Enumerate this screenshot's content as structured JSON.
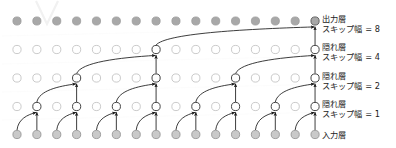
{
  "figure": {
    "title_hidden_watermark": "V",
    "background_color": "#ffffff",
    "node_fill_active": "#ffffff",
    "node_fill_inactive_top": "#a8a8a8",
    "node_fill_inactive_bottom": "#c9c9c9",
    "node_stroke": "#6f6f6f",
    "arrow_color": "#1a1a1a",
    "label_color": "#1c1c1c"
  },
  "labels": {
    "output_layer": {
      "main": "出力層",
      "sub": "スキップ幅 = 8"
    },
    "hidden_layer_4": {
      "main": "隠れ層",
      "sub": "スキップ幅 = 4"
    },
    "hidden_layer_2": {
      "main": "隠れ層",
      "sub": "スキップ幅 = 2"
    },
    "hidden_layer_1": {
      "main": "隠れ層",
      "sub": "スキップ幅 = 1"
    },
    "input_layer": {
      "main": "入力層",
      "sub": ""
    }
  },
  "chart_data": {
    "type": "diagram",
    "title": "",
    "columns": 16,
    "rows": 5,
    "geometry": {
      "x_first": 17,
      "x_step": 19.87,
      "node_radius": 4.1,
      "row_y": [
        21,
        49.5,
        78,
        106.5,
        134.5
      ]
    },
    "layers": [
      {
        "index": 0,
        "name": "output",
        "label_main": "出力層",
        "label_sub": "スキップ幅 = 8",
        "dilation": 8,
        "y": 21,
        "node_style": "filled-dark",
        "active_nodes": [
          15
        ]
      },
      {
        "index": 1,
        "name": "hidden-4",
        "label_main": "隠れ層",
        "label_sub": "スキップ幅 = 4",
        "dilation": 4,
        "y": 49.5,
        "node_style": "hollow",
        "active_nodes": [
          7,
          15
        ]
      },
      {
        "index": 2,
        "name": "hidden-2",
        "label_main": "隠れ層",
        "label_sub": "スキップ幅 = 2",
        "dilation": 2,
        "y": 78,
        "node_style": "hollow",
        "active_nodes": [
          3,
          7,
          11,
          15
        ]
      },
      {
        "index": 3,
        "name": "hidden-1",
        "label_main": "隠れ層",
        "label_sub": "スキップ幅 = 1",
        "dilation": 1,
        "y": 106.5,
        "node_style": "hollow",
        "active_nodes": [
          1,
          3,
          5,
          7,
          9,
          11,
          13,
          15
        ]
      },
      {
        "index": 4,
        "name": "input",
        "label_main": "入力層",
        "label_sub": "",
        "dilation": 0,
        "y": 134.5,
        "node_style": "filled-light",
        "active_nodes": [
          0,
          1,
          2,
          3,
          4,
          5,
          6,
          7,
          8,
          9,
          10,
          11,
          12,
          13,
          14,
          15
        ]
      }
    ],
    "edges": [
      {
        "from_layer": 4,
        "from_col": 1,
        "to_layer": 3,
        "to_col": 1,
        "kind": "vertical"
      },
      {
        "from_layer": 4,
        "from_col": 0,
        "to_layer": 3,
        "to_col": 1,
        "kind": "curve"
      },
      {
        "from_layer": 4,
        "from_col": 3,
        "to_layer": 3,
        "to_col": 3,
        "kind": "vertical"
      },
      {
        "from_layer": 4,
        "from_col": 2,
        "to_layer": 3,
        "to_col": 3,
        "kind": "curve"
      },
      {
        "from_layer": 4,
        "from_col": 5,
        "to_layer": 3,
        "to_col": 5,
        "kind": "vertical"
      },
      {
        "from_layer": 4,
        "from_col": 4,
        "to_layer": 3,
        "to_col": 5,
        "kind": "curve"
      },
      {
        "from_layer": 4,
        "from_col": 7,
        "to_layer": 3,
        "to_col": 7,
        "kind": "vertical"
      },
      {
        "from_layer": 4,
        "from_col": 6,
        "to_layer": 3,
        "to_col": 7,
        "kind": "curve"
      },
      {
        "from_layer": 4,
        "from_col": 9,
        "to_layer": 3,
        "to_col": 9,
        "kind": "vertical"
      },
      {
        "from_layer": 4,
        "from_col": 8,
        "to_layer": 3,
        "to_col": 9,
        "kind": "curve"
      },
      {
        "from_layer": 4,
        "from_col": 11,
        "to_layer": 3,
        "to_col": 11,
        "kind": "vertical"
      },
      {
        "from_layer": 4,
        "from_col": 10,
        "to_layer": 3,
        "to_col": 11,
        "kind": "curve"
      },
      {
        "from_layer": 4,
        "from_col": 13,
        "to_layer": 3,
        "to_col": 13,
        "kind": "vertical"
      },
      {
        "from_layer": 4,
        "from_col": 12,
        "to_layer": 3,
        "to_col": 13,
        "kind": "curve"
      },
      {
        "from_layer": 4,
        "from_col": 15,
        "to_layer": 3,
        "to_col": 15,
        "kind": "vertical"
      },
      {
        "from_layer": 4,
        "from_col": 14,
        "to_layer": 3,
        "to_col": 15,
        "kind": "curve"
      },
      {
        "from_layer": 3,
        "from_col": 3,
        "to_layer": 2,
        "to_col": 3,
        "kind": "vertical"
      },
      {
        "from_layer": 3,
        "from_col": 1,
        "to_layer": 2,
        "to_col": 3,
        "kind": "curve"
      },
      {
        "from_layer": 3,
        "from_col": 7,
        "to_layer": 2,
        "to_col": 7,
        "kind": "vertical"
      },
      {
        "from_layer": 3,
        "from_col": 5,
        "to_layer": 2,
        "to_col": 7,
        "kind": "curve"
      },
      {
        "from_layer": 3,
        "from_col": 11,
        "to_layer": 2,
        "to_col": 11,
        "kind": "vertical"
      },
      {
        "from_layer": 3,
        "from_col": 9,
        "to_layer": 2,
        "to_col": 11,
        "kind": "curve"
      },
      {
        "from_layer": 3,
        "from_col": 15,
        "to_layer": 2,
        "to_col": 15,
        "kind": "vertical"
      },
      {
        "from_layer": 3,
        "from_col": 13,
        "to_layer": 2,
        "to_col": 15,
        "kind": "curve"
      },
      {
        "from_layer": 2,
        "from_col": 7,
        "to_layer": 1,
        "to_col": 7,
        "kind": "vertical"
      },
      {
        "from_layer": 2,
        "from_col": 3,
        "to_layer": 1,
        "to_col": 7,
        "kind": "curve"
      },
      {
        "from_layer": 2,
        "from_col": 15,
        "to_layer": 1,
        "to_col": 15,
        "kind": "vertical"
      },
      {
        "from_layer": 2,
        "from_col": 11,
        "to_layer": 1,
        "to_col": 15,
        "kind": "curve"
      },
      {
        "from_layer": 1,
        "from_col": 15,
        "to_layer": 0,
        "to_col": 15,
        "kind": "vertical"
      },
      {
        "from_layer": 1,
        "from_col": 7,
        "to_layer": 0,
        "to_col": 15,
        "kind": "curve"
      }
    ]
  }
}
